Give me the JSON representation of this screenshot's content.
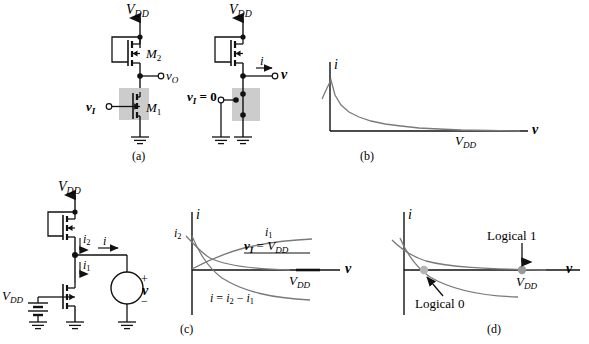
{
  "figure": {
    "kind": "circuit-and-iv-characteristics",
    "background": "#ffffff",
    "ink": "#000000",
    "curve_color": "#6b6b6b",
    "shade_color": "#cccccc"
  },
  "panels": [
    {
      "id": "a",
      "caption": "(a)",
      "type": "circuit",
      "labels": {
        "supply": "V",
        "supply_sub": "DD",
        "m2": "M",
        "m2_sub": "2",
        "m1": "M",
        "m1_sub": "1",
        "vout": "v",
        "vout_sub": "O",
        "vin": "v",
        "vin_sub": "I"
      }
    },
    {
      "id": "b",
      "caption": "(b)",
      "type": "circuit-plus-plot",
      "labels": {
        "supply": "V",
        "supply_sub": "DD",
        "current": "i",
        "terminal_v": "v",
        "vin_zero": "v",
        "vin_zero_sub": "I",
        "vin_zero_rest": "= 0"
      },
      "chart": {
        "type": "line",
        "xlabel": "v",
        "ylabel": "i",
        "xticks": [
          {
            "label": "V",
            "sub": "DD",
            "x_frac": 0.78
          }
        ],
        "grid": false,
        "series": [
          {
            "name": "pmos-load-curve",
            "comment": "monotonically decreasing convex curve starting high near v=0 and asymptotically approaching i=0 past V_DD",
            "points": [
              [
                0.0,
                1.0
              ],
              [
                0.03,
                0.74
              ],
              [
                0.06,
                0.56
              ],
              [
                0.1,
                0.42
              ],
              [
                0.15,
                0.31
              ],
              [
                0.21,
                0.24
              ],
              [
                0.28,
                0.19
              ],
              [
                0.36,
                0.15
              ],
              [
                0.45,
                0.12
              ],
              [
                0.55,
                0.09
              ],
              [
                0.65,
                0.07
              ],
              [
                0.75,
                0.05
              ],
              [
                0.85,
                0.035
              ],
              [
                1.0,
                0.02
              ]
            ]
          }
        ]
      }
    },
    {
      "id": "c",
      "caption": "(c)",
      "type": "circuit-plus-plot",
      "labels": {
        "supply_top": "V",
        "supply_top_sub": "DD",
        "supply_left": "V",
        "supply_left_sub": "DD",
        "i2": "i",
        "i2_sub": "2",
        "i1": "i",
        "i1_sub": "1",
        "i": "i",
        "source_v": "v",
        "source_plus": "+",
        "source_minus": "−"
      },
      "chart": {
        "type": "line",
        "xlabel": "v",
        "ylabel": "i",
        "xticks": [
          {
            "label": "V",
            "sub": "DD",
            "x_frac": 0.8
          }
        ],
        "yticks": [
          {
            "label": "i",
            "sub": "2",
            "y_frac": 0.72
          }
        ],
        "grid": false,
        "annotations": [
          {
            "name": "i1-curve-label",
            "text_main": "i",
            "text_sub": "1",
            "x_frac": 0.62,
            "y_frac": 0.9
          },
          {
            "name": "vi-equals-vdd-label",
            "text": "v_I = V_DD",
            "x_frac": 0.62,
            "y_frac": 0.76,
            "underlined": true
          },
          {
            "name": "i-difference-label",
            "text": "i = i_2 − i_1",
            "x_frac": 0.26,
            "y_frac": 0.1
          }
        ],
        "series": [
          {
            "name": "i1-rising-curve",
            "comment": "i1 rises from 0 and saturates toward a plateau (NMOS driver current with v_I = V_DD)",
            "points": [
              [
                0.0,
                0.02
              ],
              [
                0.04,
                0.22
              ],
              [
                0.09,
                0.39
              ],
              [
                0.15,
                0.52
              ],
              [
                0.22,
                0.62
              ],
              [
                0.31,
                0.7
              ],
              [
                0.41,
                0.76
              ],
              [
                0.52,
                0.8
              ],
              [
                0.64,
                0.83
              ],
              [
                0.77,
                0.85
              ],
              [
                0.9,
                0.86
              ]
            ]
          },
          {
            "name": "i2-falling-curve",
            "comment": "i2 (PMOS load) decays from a high value near v=0 toward zero at V_DD",
            "points": [
              [
                0.0,
                0.86
              ],
              [
                0.04,
                0.65
              ],
              [
                0.09,
                0.5
              ],
              [
                0.15,
                0.39
              ],
              [
                0.22,
                0.31
              ],
              [
                0.31,
                0.24
              ],
              [
                0.41,
                0.18
              ],
              [
                0.52,
                0.14
              ],
              [
                0.64,
                0.11
              ],
              [
                0.77,
                0.08
              ],
              [
                0.9,
                0.06
              ]
            ]
          },
          {
            "name": "i-difference-curve",
            "comment": "i = i2 - i1, crosses zero near v=0 and goes negative, saturating below the axis",
            "points": [
              [
                0.0,
                0.84
              ],
              [
                0.03,
                0.46
              ],
              [
                0.06,
                0.18
              ],
              [
                0.09,
                0.02
              ],
              [
                0.13,
                -0.14
              ],
              [
                0.2,
                -0.34
              ],
              [
                0.29,
                -0.5
              ],
              [
                0.4,
                -0.62
              ],
              [
                0.52,
                -0.7
              ],
              [
                0.65,
                -0.75
              ],
              [
                0.8,
                -0.78
              ]
            ]
          }
        ]
      }
    },
    {
      "id": "d",
      "caption": "(d)",
      "type": "plot",
      "chart": {
        "type": "line",
        "xlabel": "v",
        "ylabel": "i",
        "xticks": [
          {
            "label": "V",
            "sub": "DD",
            "x_frac": 0.8
          }
        ],
        "grid": false,
        "annotations": [
          {
            "name": "logical-1-label",
            "text": "Logical 1",
            "x_frac": 0.62,
            "y_frac": 0.72
          },
          {
            "name": "logical-0-label",
            "text": "Logical 0",
            "x_frac": 0.16,
            "y_frac": -0.62
          }
        ],
        "markers": [
          {
            "name": "logical-1-point",
            "x_frac": 0.8,
            "y_frac": 0.0
          },
          {
            "name": "logical-0-point",
            "x_frac": 0.09,
            "y_frac": 0.0
          }
        ],
        "series": [
          {
            "name": "upper-decaying-curve",
            "comment": "upper curve decaying from above the axis and asymptotically approaching the axis near V_DD",
            "points": [
              [
                0.0,
                0.8
              ],
              [
                0.04,
                0.62
              ],
              [
                0.09,
                0.49
              ],
              [
                0.15,
                0.39
              ],
              [
                0.22,
                0.31
              ],
              [
                0.31,
                0.24
              ],
              [
                0.41,
                0.18
              ],
              [
                0.52,
                0.13
              ],
              [
                0.64,
                0.09
              ],
              [
                0.77,
                0.05
              ],
              [
                0.92,
                0.03
              ]
            ]
          },
          {
            "name": "lower-decaying-curve",
            "comment": "second curve crossing the first near the origin region and dropping below the axis",
            "points": [
              [
                0.0,
                0.72
              ],
              [
                0.03,
                0.44
              ],
              [
                0.06,
                0.22
              ],
              [
                0.09,
                0.04
              ],
              [
                0.13,
                -0.12
              ],
              [
                0.2,
                -0.32
              ],
              [
                0.29,
                -0.48
              ],
              [
                0.4,
                -0.6
              ],
              [
                0.52,
                -0.68
              ],
              [
                0.66,
                -0.73
              ],
              [
                0.82,
                -0.76
              ]
            ]
          }
        ]
      }
    }
  ]
}
